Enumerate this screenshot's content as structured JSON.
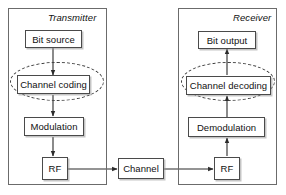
{
  "diagram": {
    "panels": [
      {
        "id": "transmitter",
        "label": "Transmitter"
      },
      {
        "id": "receiver",
        "label": "Receiver"
      }
    ],
    "blocks": {
      "bit_source": "Bit source",
      "channel_coding": "Channel coding",
      "modulation": "Modulation",
      "tx_rf": "RF",
      "channel": "Channel",
      "rx_rf": "RF",
      "demodulation": "Demodulation",
      "channel_decoding": "Channel decoding",
      "bit_output": "Bit output"
    },
    "highlights": [
      {
        "id": "tx-coding-highlight",
        "target": "channel_coding",
        "style": "dashed-ellipse"
      },
      {
        "id": "rx-decoding-highlight",
        "target": "channel_decoding",
        "style": "dashed-ellipse"
      }
    ],
    "flow": [
      {
        "from": "bit_source",
        "to": "channel_coding"
      },
      {
        "from": "channel_coding",
        "to": "modulation"
      },
      {
        "from": "modulation",
        "to": "tx_rf"
      },
      {
        "from": "tx_rf",
        "to": "channel"
      },
      {
        "from": "channel",
        "to": "rx_rf"
      },
      {
        "from": "rx_rf",
        "to": "demodulation"
      },
      {
        "from": "demodulation",
        "to": "channel_decoding"
      },
      {
        "from": "channel_decoding",
        "to": "bit_output"
      }
    ],
    "colors": {
      "panel_border": "#6b6b6b",
      "box_border": "#4a4a4a",
      "line": "#2b2b2b",
      "dashed": "#3d3d3d",
      "text": "#111111",
      "background": "#ffffff"
    }
  }
}
